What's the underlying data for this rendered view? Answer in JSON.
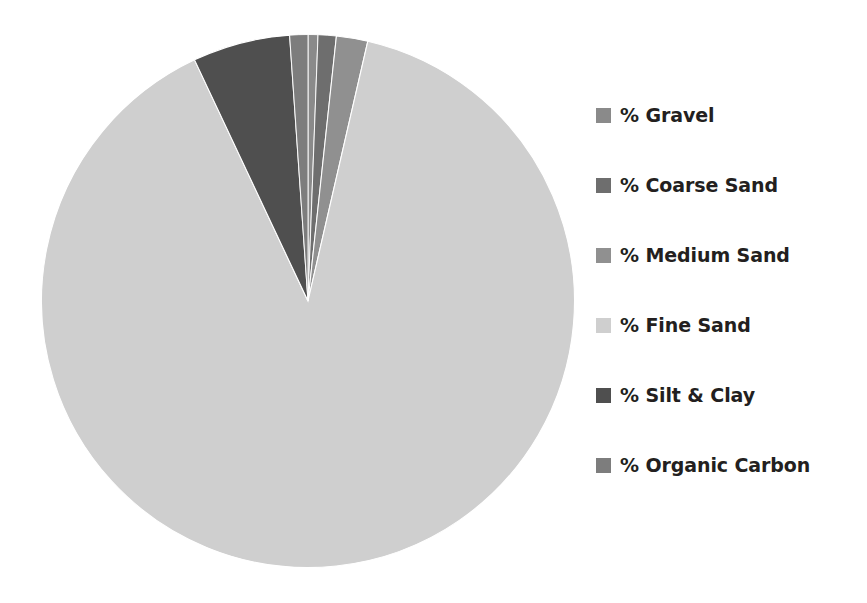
{
  "chart_data": {
    "type": "pie",
    "title": "",
    "subtitle": "",
    "xlabel": "",
    "ylabel": "",
    "grid": false,
    "legend_position": "right",
    "start_angle_deg": 0,
    "direction": "clockwise",
    "categories": [
      "% Gravel",
      "% Coarse Sand",
      "% Medium Sand",
      "% Fine Sand",
      "% Silt & Clay",
      "% Organic Carbon"
    ],
    "values": [
      0.6,
      1.1,
      1.9,
      89.4,
      5.9,
      1.1
    ],
    "colors": [
      "#8a8a8a",
      "#6e6e6e",
      "#909090",
      "#cfcfcf",
      "#4f4f4f",
      "#7d7d7d"
    ],
    "series": [
      {
        "name": "Sediment Composition",
        "values": [
          0.6,
          1.1,
          1.9,
          89.4,
          5.9,
          1.1
        ]
      }
    ],
    "slices": [
      {
        "label": "% Gravel",
        "value": 0.6,
        "color": "#8a8a8a"
      },
      {
        "label": "% Coarse Sand",
        "value": 1.1,
        "color": "#6e6e6e"
      },
      {
        "label": "% Medium Sand",
        "value": 1.9,
        "color": "#909090"
      },
      {
        "label": "% Fine Sand",
        "value": 89.4,
        "color": "#cfcfcf"
      },
      {
        "label": "% Silt & Clay",
        "value": 5.9,
        "color": "#4f4f4f"
      },
      {
        "label": "% Organic Carbon",
        "value": 1.1,
        "color": "#7d7d7d"
      }
    ]
  },
  "legend": {
    "items": [
      {
        "label": "% Gravel",
        "color": "#8a8a8a",
        "swatch_name": "legend-swatch-gravel"
      },
      {
        "label": "% Coarse Sand",
        "color": "#6e6e6e",
        "swatch_name": "legend-swatch-coarse-sand"
      },
      {
        "label": "% Medium Sand",
        "color": "#909090",
        "swatch_name": "legend-swatch-medium-sand"
      },
      {
        "label": "% Fine Sand",
        "color": "#cfcfcf",
        "swatch_name": "legend-swatch-fine-sand"
      },
      {
        "label": "% Silt & Clay",
        "color": "#4f4f4f",
        "swatch_name": "legend-swatch-silt-clay"
      },
      {
        "label": "% Organic Carbon",
        "color": "#7d7d7d",
        "swatch_name": "legend-swatch-organic-carbon"
      }
    ]
  },
  "canvas": {
    "background": "#ffffff",
    "text_color": "#231f20"
  }
}
